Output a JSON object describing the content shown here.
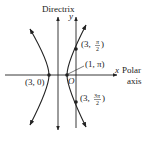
{
  "diagram": {
    "type": "polar-conic-hyperbola",
    "labels": {
      "directrix": "Directrix",
      "y_axis": "y",
      "x_axis": "x",
      "polar": "Polar",
      "axis": "axis",
      "origin": "O"
    },
    "points": [
      {
        "id": "p1",
        "r": "3",
        "theta": "0",
        "label": "(3, 0)"
      },
      {
        "id": "p2",
        "r": "1",
        "theta": "π",
        "label": "(1, π)"
      },
      {
        "id": "p3",
        "r": "3",
        "theta_num": "π",
        "theta_den": "2",
        "label": "(3, π/2)"
      },
      {
        "id": "p4",
        "r": "3",
        "theta_num": "3π",
        "theta_den": "2",
        "label": "(3, 3π/2)"
      }
    ],
    "text": {
      "p1": "(3, 0)",
      "p2": "(1, π)",
      "p3_open": "(3,",
      "p3_num": "π",
      "p3_den": "2",
      "p4_open": "(3,",
      "p4_num": "3π",
      "p4_den": "2",
      "close": ")"
    },
    "colors": {
      "stroke": "#222222",
      "background": "#ffffff"
    }
  }
}
